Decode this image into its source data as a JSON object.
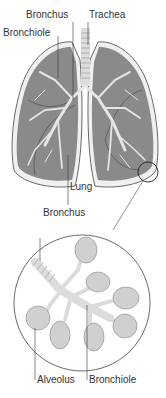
{
  "labels": {
    "bronchus_top": "Bronchus",
    "trachea": "Trachea",
    "bronchiole_top": "Bronchiole",
    "lung": "Lung",
    "bronchus_detail": "Bronchus",
    "alveolus": "Alveolus",
    "bronchiole_detail": "Bronchiole"
  },
  "colors": {
    "lung_fill": "#8a8a8a",
    "lung_outline": "#dddddd",
    "airway": "#e8e8e8",
    "line": "#333333"
  }
}
